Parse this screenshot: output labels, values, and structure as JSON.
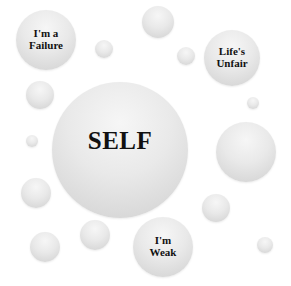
{
  "diagram": {
    "center": {
      "label": "SELF",
      "cx": 120,
      "cy": 150,
      "r": 68
    },
    "labeled_bubbles": [
      {
        "label": "I'm a\nFailure",
        "cx": 46,
        "cy": 40,
        "r": 30
      },
      {
        "label": "Life's\nUnfair",
        "cx": 232,
        "cy": 58,
        "r": 28
      },
      {
        "label": "I'm\nWeak",
        "cx": 163,
        "cy": 247,
        "r": 30
      }
    ],
    "unlabeled_bubbles": [
      {
        "cx": 104,
        "cy": 49,
        "r": 9
      },
      {
        "cx": 158,
        "cy": 22,
        "r": 16
      },
      {
        "cx": 186,
        "cy": 56,
        "r": 9
      },
      {
        "cx": 40,
        "cy": 95,
        "r": 14
      },
      {
        "cx": 253,
        "cy": 103,
        "r": 6
      },
      {
        "cx": 32,
        "cy": 141,
        "r": 6
      },
      {
        "cx": 246,
        "cy": 152,
        "r": 30
      },
      {
        "cx": 36,
        "cy": 193,
        "r": 15
      },
      {
        "cx": 45,
        "cy": 247,
        "r": 15
      },
      {
        "cx": 95,
        "cy": 235,
        "r": 15
      },
      {
        "cx": 216,
        "cy": 208,
        "r": 14
      },
      {
        "cx": 265,
        "cy": 245,
        "r": 8
      }
    ],
    "colors": {
      "background": "#ffffff",
      "bubble": "#e6e6e6",
      "text": "#111111"
    }
  }
}
